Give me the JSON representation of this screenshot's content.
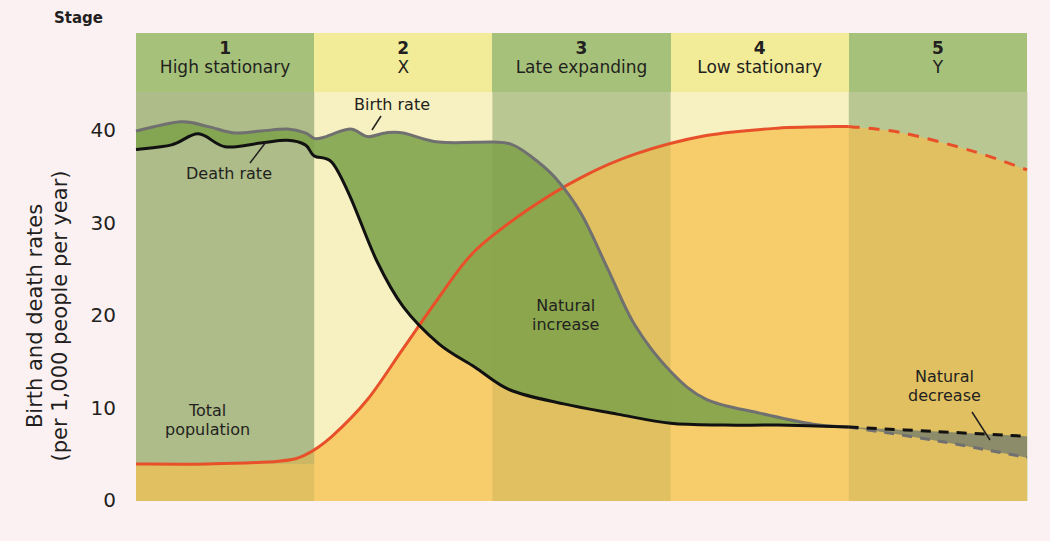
{
  "chart_data": {
    "type": "line",
    "xlabel": "Stage",
    "ylabel": "Birth and death rates (per 1,000 people per year)",
    "ylabel_lines": [
      "Birth and death rates",
      "(per 1,000 people per year)"
    ],
    "ylim": [
      0,
      45
    ],
    "yticks": [
      0,
      10,
      20,
      30,
      40
    ],
    "grid": false,
    "legend": "inline annotations",
    "stages": [
      {
        "num": "1",
        "name": "High stationary"
      },
      {
        "num": "2",
        "name": "X"
      },
      {
        "num": "3",
        "name": "Late expanding"
      },
      {
        "num": "4",
        "name": "Low stationary"
      },
      {
        "num": "5",
        "name": "Y"
      }
    ],
    "x_domain": [
      0,
      5
    ],
    "series": [
      {
        "name": "Birth rate",
        "color": "#707070",
        "x": [
          0,
          0.25,
          0.4,
          0.55,
          0.7,
          0.85,
          0.95,
          1.0,
          1.05,
          1.2,
          1.3,
          1.4,
          1.5,
          1.7,
          2.0,
          2.1,
          2.2,
          2.35,
          2.5,
          2.65,
          2.8,
          3.0,
          3.2,
          3.5,
          3.8,
          4.0
        ],
        "values": [
          40,
          41,
          40.5,
          39.8,
          40,
          40.2,
          39.8,
          39.2,
          39.3,
          40.2,
          39.4,
          39.8,
          39.8,
          38.8,
          38.8,
          38.6,
          37.5,
          35,
          31,
          25,
          19,
          14,
          11,
          9.5,
          8.3,
          8
        ],
        "dashed_from_x": 4.0,
        "dashed": {
          "x": [
            4.0,
            4.5,
            5.0
          ],
          "values": [
            8,
            6.5,
            4.7
          ]
        }
      },
      {
        "name": "Death rate",
        "color": "#111111",
        "x": [
          0,
          0.2,
          0.35,
          0.5,
          0.7,
          0.85,
          0.95,
          1.0,
          1.1,
          1.2,
          1.35,
          1.5,
          1.7,
          1.9,
          2.1,
          2.4,
          2.7,
          3.0,
          3.3,
          3.6,
          4.0
        ],
        "values": [
          38,
          38.5,
          39.7,
          38.3,
          38.7,
          39,
          38.5,
          37.3,
          36.6,
          33,
          26,
          21,
          17,
          14.5,
          12,
          10.5,
          9.4,
          8.4,
          8.2,
          8.2,
          8
        ],
        "dashed": {
          "x": [
            4.0,
            4.5,
            5.0
          ],
          "values": [
            8,
            7.5,
            7
          ]
        }
      },
      {
        "name": "Total population",
        "color": "#e8502a",
        "x": [
          0,
          0.4,
          0.8,
          0.95,
          1.1,
          1.3,
          1.5,
          1.7,
          1.9,
          2.2,
          2.5,
          2.8,
          3.2,
          3.6,
          4.0
        ],
        "values": [
          4,
          4,
          4.3,
          5,
          7,
          11,
          16.5,
          22,
          27,
          31.5,
          35,
          37.5,
          39.5,
          40.3,
          40.5
        ],
        "dashed": {
          "x": [
            4.0,
            4.3,
            4.7,
            5.0
          ],
          "values": [
            40.5,
            39.8,
            37.8,
            35.8
          ]
        }
      }
    ],
    "annotations": [
      {
        "text": "Birth rate",
        "stage": 2
      },
      {
        "text": "Death rate",
        "stage": 1
      },
      {
        "text": "Natural increase",
        "stage": 3
      },
      {
        "text": "Total population",
        "stage": 1
      },
      {
        "text": "Natural decrease",
        "stage": 5
      }
    ],
    "colors": {
      "header_green": "#a6c27a",
      "header_yellow": "#f2ec98",
      "band_green": "#c9d6a6",
      "band_yellow": "#f7f0c0",
      "natural_increase": "#7ea24a",
      "population_fill": "#f7cd6c",
      "natural_decrease": "#8d8c6a",
      "background": "#fbf1f3"
    }
  },
  "labels": {
    "stage_word": "Stage",
    "birth_rate": "Birth rate",
    "death_rate": "Death rate",
    "natural_increase_l1": "Natural",
    "natural_increase_l2": "increase",
    "total_population_l1": "Total",
    "total_population_l2": "population",
    "natural_decrease_l1": "Natural",
    "natural_decrease_l2": "decrease"
  }
}
